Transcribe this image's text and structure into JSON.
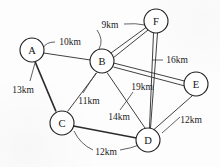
{
  "diagram": {
    "unit": "km",
    "background_color": "#fdfdfd",
    "line_color": "#2b2b2b",
    "node_fill": "#ffffff"
  },
  "nodes": [
    {
      "id": "A",
      "label": "A",
      "x": 32,
      "y": 50,
      "r": 12
    },
    {
      "id": "B",
      "label": "B",
      "x": 102,
      "y": 61,
      "r": 12
    },
    {
      "id": "C",
      "label": "C",
      "x": 62,
      "y": 123,
      "r": 12
    },
    {
      "id": "D",
      "label": "D",
      "x": 148,
      "y": 140,
      "r": 12
    },
    {
      "id": "E",
      "label": "E",
      "x": 196,
      "y": 84,
      "r": 12
    },
    {
      "id": "F",
      "label": "F",
      "x": 156,
      "y": 21,
      "r": 12
    }
  ],
  "edges": [
    {
      "id": "A-B",
      "from": "A",
      "to": "B",
      "weight": 10,
      "weight_label": "10km"
    },
    {
      "id": "A-C",
      "from": "A",
      "to": "C",
      "weight": 13,
      "weight_label": "13km"
    },
    {
      "id": "B-C",
      "from": "B",
      "to": "C",
      "weight": 11,
      "weight_label": "11km"
    },
    {
      "id": "B-D",
      "from": "B",
      "to": "D",
      "weight": 14,
      "weight_label": "14km"
    },
    {
      "id": "B-E",
      "from": "B",
      "to": "E",
      "weight": 16,
      "weight_label": "16km"
    },
    {
      "id": "B-F",
      "from": "B",
      "to": "F",
      "weight": 9,
      "weight_label": "9km"
    },
    {
      "id": "C-D",
      "from": "C",
      "to": "D",
      "weight": 12,
      "weight_label": "12km"
    },
    {
      "id": "D-E",
      "from": "D",
      "to": "E",
      "weight": 12,
      "weight_label": "12km"
    },
    {
      "id": "D-F",
      "from": "D",
      "to": "F",
      "weight": 19,
      "weight_label": "19km"
    }
  ],
  "labels": {
    "w_9km": {
      "text": "9km",
      "x": 110,
      "y": 25
    },
    "w_10km": {
      "text": "10km",
      "x": 70,
      "y": 42
    },
    "w_16km": {
      "text": "16km",
      "x": 177,
      "y": 60
    },
    "w_13km": {
      "text": "13km",
      "x": 23,
      "y": 90
    },
    "w_11km": {
      "text": "11km",
      "x": 89,
      "y": 101
    },
    "w_19km": {
      "text": "19km",
      "x": 142,
      "y": 87
    },
    "w_14km": {
      "text": "14km",
      "x": 119,
      "y": 117
    },
    "w_12km_d": {
      "text": "12km",
      "x": 106,
      "y": 152
    },
    "w_12km_e": {
      "text": "12km",
      "x": 191,
      "y": 120
    }
  }
}
